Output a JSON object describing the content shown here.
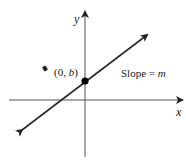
{
  "diagram": {
    "axes": {
      "x_label": "x",
      "y_label": "y",
      "color": "#222222"
    },
    "line": {
      "color": "#2a2a2a",
      "arrows": "both",
      "start": [
        20,
        130
      ],
      "end": [
        148,
        34
      ]
    },
    "intercept_point": {
      "label_open": "(0, ",
      "label_var": "b",
      "label_close": ")",
      "color": "#000000"
    },
    "slope_annotation": {
      "text": "Slope = ",
      "var": "m"
    }
  }
}
